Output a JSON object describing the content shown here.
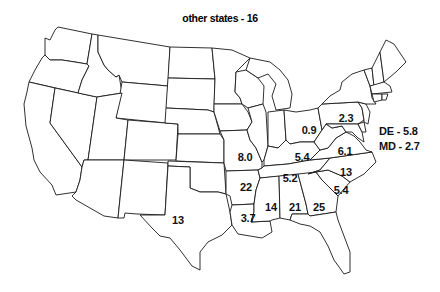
{
  "title": "other states - 16",
  "map": {
    "type": "choropleth-labels",
    "region": "contiguous United States",
    "style": "black outlines on white, no fill"
  },
  "labels": [
    {
      "state": "Ohio",
      "value": "0.9",
      "x": 309,
      "y": 130
    },
    {
      "state": "Pennsylvania",
      "value": "2.3",
      "x": 346,
      "y": 118
    },
    {
      "state": "Missouri",
      "value": "8.0",
      "x": 245,
      "y": 157
    },
    {
      "state": "Kentucky",
      "value": "5.4",
      "x": 302,
      "y": 157
    },
    {
      "state": "Virginia",
      "value": "6.1",
      "x": 345,
      "y": 151
    },
    {
      "state": "North Carolina",
      "value": "13",
      "x": 346,
      "y": 172
    },
    {
      "state": "Tennessee",
      "value": "5.2",
      "x": 290,
      "y": 178
    },
    {
      "state": "Arkansas",
      "value": "22",
      "x": 246,
      "y": 187
    },
    {
      "state": "South Carolina",
      "value": "5.4",
      "x": 341,
      "y": 190
    },
    {
      "state": "Texas",
      "value": "13",
      "x": 178,
      "y": 220
    },
    {
      "state": "Louisiana",
      "value": "3.7",
      "x": 248,
      "y": 218
    },
    {
      "state": "Mississippi",
      "value": "14",
      "x": 271,
      "y": 207
    },
    {
      "state": "Alabama",
      "value": "21",
      "x": 295,
      "y": 207
    },
    {
      "state": "Georgia",
      "value": "25",
      "x": 319,
      "y": 207
    }
  ],
  "side_labels": [
    {
      "state": "Delaware",
      "text": "DE - 5.8",
      "x": 379,
      "y": 132
    },
    {
      "state": "Maryland",
      "text": "MD - 2.7",
      "x": 379,
      "y": 147
    }
  ],
  "chart_data": {
    "type": "map",
    "title": "other states - 16",
    "values": {
      "Ohio": 0.9,
      "Pennsylvania": 2.3,
      "Missouri": 8.0,
      "Kentucky": 5.4,
      "Virginia": 6.1,
      "North Carolina": 13,
      "Tennessee": 5.2,
      "Arkansas": 22,
      "South Carolina": 5.4,
      "Texas": 13,
      "Louisiana": 3.7,
      "Mississippi": 14,
      "Alabama": 21,
      "Georgia": 25,
      "Delaware": 5.8,
      "Maryland": 2.7,
      "other states": 16
    }
  }
}
